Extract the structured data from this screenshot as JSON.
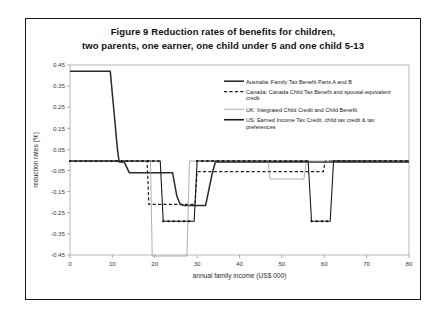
{
  "figure": {
    "title_line1": "Figure 9   Reduction rates of benefits for children,",
    "title_line2": "two parents, one earner, one child under 5 and one child 5-13"
  },
  "chart_data": {
    "type": "line",
    "title": "Figure 9 Reduction rates of benefits for children, two parents, one earner, one child under 5 and one child 5-13",
    "xlabel": "annual family income (US$ 000)",
    "ylabel": "reduction rates (%)",
    "xlim": [
      0,
      80
    ],
    "ylim": [
      -0.45,
      0.45
    ],
    "xticks": [
      0,
      10,
      20,
      30,
      40,
      50,
      60,
      70,
      80
    ],
    "xtick_labels": [
      "0",
      "10",
      "20",
      "30",
      "40",
      "50",
      "60",
      "70",
      "80"
    ],
    "yticks": [
      0.45,
      0.35,
      0.25,
      0.15,
      0.05,
      -0.05,
      -0.15,
      -0.25,
      -0.35,
      -0.45
    ],
    "ytick_labels": [
      "0.45",
      "0.35",
      "0.25",
      "0.15",
      "0.05",
      "-0.05",
      "-0.15",
      "-0.25",
      "-0.35",
      "-0.45"
    ],
    "grid": false,
    "legend_position": "upper-right-inside",
    "series": [
      {
        "name": "Australia: Family Tax Benefit Parts A and B",
        "key": "australia",
        "style": "solid-thick",
        "color": "#2b2b2b",
        "width": 1.5,
        "marker": "none",
        "points": [
          [
            0,
            0.42
          ],
          [
            9.5,
            0.42
          ],
          [
            11.2,
            0.05
          ],
          [
            11.6,
            -0.01
          ],
          [
            12.8,
            -0.01
          ],
          [
            14.0,
            -0.06
          ],
          [
            21.5,
            -0.06
          ],
          [
            24.2,
            -0.06
          ],
          [
            25.2,
            -0.17
          ],
          [
            26.0,
            -0.21
          ],
          [
            27.0,
            -0.215
          ],
          [
            32.0,
            -0.215
          ],
          [
            33.5,
            -0.07
          ],
          [
            34.3,
            -0.01
          ],
          [
            80,
            -0.01
          ]
        ]
      },
      {
        "name": "Canada: Canada Child Tax Benefit and spousal equivalent credit",
        "key": "canada",
        "style": "dashed",
        "color": "#1f1f1f",
        "width": 1.2,
        "marker": "none",
        "points": [
          [
            0,
            -0.005
          ],
          [
            18.2,
            -0.005
          ],
          [
            18.6,
            -0.21
          ],
          [
            29.5,
            -0.21
          ],
          [
            30.0,
            -0.055
          ],
          [
            59.8,
            -0.055
          ],
          [
            60.2,
            -0.005
          ],
          [
            80,
            -0.005
          ]
        ]
      },
      {
        "name": "UK: Integrated Child Credit and Child Benefit",
        "key": "uk",
        "style": "solid-thin",
        "color": "#9a9a9a",
        "width": 0.8,
        "marker": "none",
        "points": [
          [
            0,
            -0.005
          ],
          [
            19.0,
            -0.005
          ],
          [
            19.4,
            -0.455
          ],
          [
            27.6,
            -0.455
          ],
          [
            28.2,
            -0.005
          ],
          [
            46.8,
            -0.005
          ],
          [
            47.2,
            -0.09
          ],
          [
            55.2,
            -0.09
          ],
          [
            55.8,
            -0.005
          ],
          [
            80,
            -0.005
          ]
        ]
      },
      {
        "name": "US: Earned Income Tax Credit, child tax credit & tax preferences",
        "key": "us",
        "style": "solid-dotted",
        "color": "#1a1a1a",
        "width": 1.1,
        "marker": "square",
        "points": [
          [
            0,
            -0.005
          ],
          [
            21.3,
            -0.005
          ],
          [
            22.0,
            -0.29
          ],
          [
            29.3,
            -0.29
          ],
          [
            30.0,
            -0.005
          ],
          [
            56.2,
            -0.005
          ],
          [
            57.0,
            -0.29
          ],
          [
            61.4,
            -0.29
          ],
          [
            62.2,
            -0.005
          ],
          [
            80,
            -0.005
          ]
        ]
      }
    ],
    "legend": [
      {
        "key": "australia",
        "swatch": "solid-thick",
        "lines": [
          "Australia: Family Tax Benefit Parts A and B"
        ]
      },
      {
        "key": "canada",
        "swatch": "dashed",
        "lines": [
          "Canada: Canada Child Tax Benefit and spousal equivalent",
          "credit"
        ]
      },
      {
        "key": "uk",
        "swatch": "solid-thin",
        "lines": [
          "UK: Integrated Child Credit and Child Benefit"
        ]
      },
      {
        "key": "us",
        "swatch": "solid-thick",
        "lines": [
          "US: Earned Income Tax Credit, child tax credit & tax",
          "preferences"
        ]
      }
    ]
  }
}
